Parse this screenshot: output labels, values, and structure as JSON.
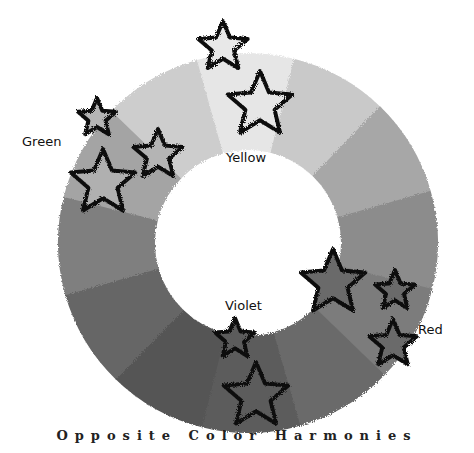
{
  "title": "Opposite Color Harmonies",
  "labels": {
    "green": "Green",
    "yellow": "Yellow",
    "violet": "Violet",
    "red": "Red"
  },
  "wheel": {
    "center": [
      248,
      243
    ],
    "outer_radius": 190,
    "inner_radius": 93,
    "start_angle": -106,
    "segment_colors": [
      "#e6e6e6",
      "#c9c9c9",
      "#a7a7a7",
      "#8c8c8c",
      "#7b7b7b",
      "#6a6a6a",
      "#5c5c5c",
      "#555555",
      "#666666",
      "#7f7f7f",
      "#a4a4a4",
      "#cdcdcd"
    ]
  },
  "stars": [
    {
      "name": "star-yellow-top",
      "cx": 223,
      "cy": 47,
      "r": 26,
      "fill": "#e8e8e8"
    },
    {
      "name": "star-yellow-large",
      "cx": 260,
      "cy": 105,
      "r": 34,
      "fill": "#e6e6e6"
    },
    {
      "name": "star-green-small",
      "cx": 97,
      "cy": 118,
      "r": 20,
      "fill": "#b4b4b4"
    },
    {
      "name": "star-green-medium",
      "cx": 158,
      "cy": 155,
      "r": 26,
      "fill": "#b4b4b4"
    },
    {
      "name": "star-green-large",
      "cx": 103,
      "cy": 183,
      "r": 34,
      "fill": "#b0b0b0"
    },
    {
      "name": "star-red-large",
      "cx": 333,
      "cy": 283,
      "r": 34,
      "fill": "#6a6a6a"
    },
    {
      "name": "star-red-small",
      "cx": 395,
      "cy": 291,
      "r": 21,
      "fill": "#6a6a6a"
    },
    {
      "name": "star-red-lower",
      "cx": 393,
      "cy": 344,
      "r": 25,
      "fill": "#6a6a6a"
    },
    {
      "name": "star-violet-small",
      "cx": 235,
      "cy": 339,
      "r": 21,
      "fill": "#5c5c5c"
    },
    {
      "name": "star-violet-large",
      "cx": 256,
      "cy": 396,
      "r": 34,
      "fill": "#5c5c5c"
    }
  ]
}
